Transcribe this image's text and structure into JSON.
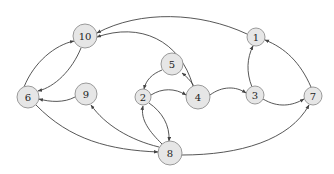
{
  "diagram": {
    "type": "directed-graph",
    "colors": {
      "node_fill": "#e6e6e6",
      "node_stroke": "#9a9a9a",
      "edge": "#444444",
      "label": "#222222"
    },
    "nodes": [
      {
        "id": "10",
        "label": "10",
        "x": 85,
        "y": 36,
        "r": 12
      },
      {
        "id": "1",
        "label": "1",
        "x": 256,
        "y": 37,
        "r": 9
      },
      {
        "id": "5",
        "label": "5",
        "x": 172,
        "y": 64,
        "r": 11
      },
      {
        "id": "6",
        "label": "6",
        "x": 28,
        "y": 97,
        "r": 11
      },
      {
        "id": "9",
        "label": "9",
        "x": 86,
        "y": 94,
        "r": 11
      },
      {
        "id": "2",
        "label": "2",
        "x": 143,
        "y": 97,
        "r": 8
      },
      {
        "id": "4",
        "label": "4",
        "x": 198,
        "y": 97,
        "r": 12
      },
      {
        "id": "3",
        "label": "3",
        "x": 255,
        "y": 95,
        "r": 9
      },
      {
        "id": "7",
        "label": "7",
        "x": 313,
        "y": 96,
        "r": 9
      },
      {
        "id": "8",
        "label": "8",
        "x": 170,
        "y": 153,
        "r": 12
      }
    ],
    "edges": [
      {
        "from": "1",
        "to": "10",
        "path": "M247,34 C200,12 140,10 97,33"
      },
      {
        "from": "4",
        "to": "10",
        "path": "M193,86 C180,40 140,22 97,37"
      },
      {
        "from": "6",
        "to": "10",
        "path": "M24,87 C34,62 55,45 74,41"
      },
      {
        "from": "10",
        "to": "6",
        "path": "M81,48 C72,70 55,87 38,91"
      },
      {
        "from": "9",
        "to": "6",
        "path": "M75,97 C64,103 50,102 39,99"
      },
      {
        "from": "6",
        "to": "8",
        "path": "M36,105 C70,140 110,150 158,152"
      },
      {
        "from": "8",
        "to": "9",
        "path": "M159,147 C130,140 105,125 91,105"
      },
      {
        "from": "8",
        "to": "2",
        "path": "M162,144 C150,132 140,120 143,106"
      },
      {
        "from": "2",
        "to": "8",
        "path": "M149,103 C162,112 170,125 169,141"
      },
      {
        "from": "5",
        "to": "2",
        "path": "M162,70 C152,74 146,80 144,89"
      },
      {
        "from": "4",
        "to": "5",
        "path": "M194,86 C190,80 186,76 182,73"
      },
      {
        "from": "2",
        "to": "4",
        "path": "M151,95 C162,88 175,88 186,95"
      },
      {
        "from": "4",
        "to": "3",
        "path": "M210,95 C222,86 236,86 246,93"
      },
      {
        "from": "3",
        "to": "1",
        "path": "M252,87 C246,72 247,58 253,46"
      },
      {
        "from": "7",
        "to": "1",
        "path": "M311,87 C300,62 285,48 265,40"
      },
      {
        "from": "3",
        "to": "7",
        "path": "M263,99 C278,108 292,106 304,99"
      },
      {
        "from": "8",
        "to": "7",
        "path": "M182,155 C240,155 290,140 309,105"
      }
    ]
  }
}
